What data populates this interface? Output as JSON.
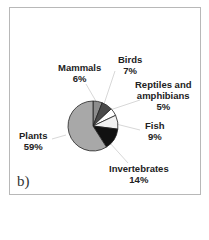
{
  "chart_data": {
    "type": "pie",
    "title": "",
    "panel_label": "b)",
    "start_angle_deg": 0,
    "direction": "clockwise",
    "slices": [
      {
        "label": "Mammals",
        "value": 6,
        "pct": "6%",
        "color": "#8c8c8c"
      },
      {
        "label": "Birds",
        "value": 7,
        "pct": "7%",
        "color": "#4a4a4a"
      },
      {
        "label": "Reptiles and amphibians",
        "value": 5,
        "pct": "5%",
        "color": "#ffffff"
      },
      {
        "label": "Fish",
        "value": 9,
        "pct": "9%",
        "color": "#f2f2f2"
      },
      {
        "label": "Invertebrates",
        "value": 14,
        "pct": "14%",
        "color": "#111111"
      },
      {
        "label": "Plants",
        "value": 59,
        "pct": "59%",
        "color": "#a8a8a8"
      }
    ]
  },
  "labels": {
    "mammals": {
      "name": "Mammals",
      "pct": "6%"
    },
    "birds": {
      "name": "Birds",
      "pct": "7%"
    },
    "reptiles": {
      "name1": "Reptiles and",
      "name2": "amphibians",
      "pct": "5%"
    },
    "fish": {
      "name": "Fish",
      "pct": "9%"
    },
    "invertebrates": {
      "name": "Invertebrates",
      "pct": "14%"
    },
    "plants": {
      "name": "Plants",
      "pct": "59%"
    }
  },
  "panel_label": "b)"
}
